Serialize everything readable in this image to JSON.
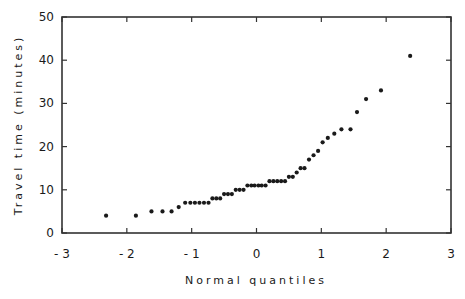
{
  "chart_data": {
    "type": "scatter",
    "title": "",
    "xlabel": "Normal quantiles",
    "ylabel": "Travel time (minutes)",
    "xlim": [
      -3,
      3
    ],
    "ylim": [
      0,
      50
    ],
    "xticks": [
      -3,
      -2,
      -1,
      0,
      1,
      2,
      3
    ],
    "xtick_labels": [
      "- 3",
      "- 2",
      "- 1",
      "0",
      "1",
      "2",
      "3"
    ],
    "yticks": [
      0,
      10,
      20,
      30,
      40,
      50
    ],
    "ytick_labels": [
      "0",
      "10",
      "20",
      "30",
      "40",
      "50"
    ],
    "grid": false,
    "legend": null,
    "marker": "*",
    "color": "#1a1a1a",
    "series": [
      {
        "name": "Travel time",
        "points": [
          [
            -2.32,
            4
          ],
          [
            -1.86,
            4
          ],
          [
            -1.62,
            5
          ],
          [
            -1.45,
            5
          ],
          [
            -1.31,
            5
          ],
          [
            -1.2,
            6
          ],
          [
            -1.1,
            7
          ],
          [
            -1.02,
            7
          ],
          [
            -0.95,
            7
          ],
          [
            -0.88,
            7
          ],
          [
            -0.81,
            7
          ],
          [
            -0.74,
            7
          ],
          [
            -0.68,
            8
          ],
          [
            -0.62,
            8
          ],
          [
            -0.56,
            8
          ],
          [
            -0.5,
            9
          ],
          [
            -0.44,
            9
          ],
          [
            -0.38,
            9
          ],
          [
            -0.32,
            10
          ],
          [
            -0.26,
            10
          ],
          [
            -0.2,
            10
          ],
          [
            -0.14,
            11
          ],
          [
            -0.08,
            11
          ],
          [
            -0.03,
            11
          ],
          [
            0.03,
            11
          ],
          [
            0.08,
            11
          ],
          [
            0.14,
            11
          ],
          [
            0.2,
            12
          ],
          [
            0.26,
            12
          ],
          [
            0.32,
            12
          ],
          [
            0.38,
            12
          ],
          [
            0.44,
            12
          ],
          [
            0.5,
            13
          ],
          [
            0.56,
            13
          ],
          [
            0.62,
            14
          ],
          [
            0.68,
            15
          ],
          [
            0.74,
            15
          ],
          [
            0.81,
            17
          ],
          [
            0.88,
            18
          ],
          [
            0.95,
            19
          ],
          [
            1.02,
            21
          ],
          [
            1.1,
            22
          ],
          [
            1.2,
            23
          ],
          [
            1.31,
            24
          ],
          [
            1.45,
            24
          ],
          [
            1.55,
            28
          ],
          [
            1.69,
            31
          ],
          [
            1.92,
            33
          ],
          [
            2.37,
            41
          ]
        ]
      }
    ]
  }
}
